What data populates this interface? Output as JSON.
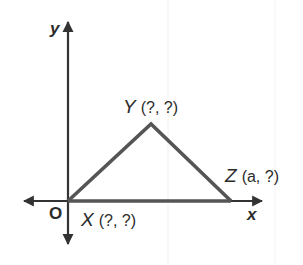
{
  "diagram": {
    "type": "coordinate-plane-triangle",
    "axes": {
      "x_label": "x",
      "y_label": "y",
      "origin_label": "O"
    },
    "vertices": [
      {
        "name": "X",
        "coord_text": "(?, ?)",
        "position": "origin"
      },
      {
        "name": "Y",
        "coord_text": "(?, ?)",
        "position": "apex"
      },
      {
        "name": "Z",
        "coord_text": "(a, ?)",
        "position": "on x-axis"
      }
    ],
    "colors": {
      "axis": "#333333",
      "triangle": "#555555",
      "text": "#2b2b2b",
      "background": "#ffffff"
    }
  }
}
